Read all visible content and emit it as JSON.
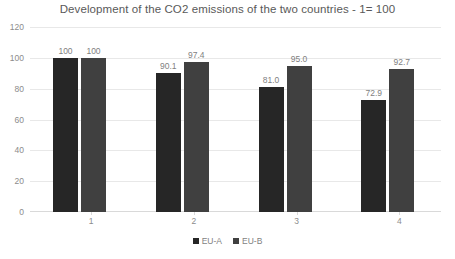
{
  "chart_data": {
    "type": "bar",
    "title": "Development of the CO2 emissions of the two countries - 1= 100",
    "xlabel": "",
    "ylabel": "",
    "categories": [
      "1",
      "2",
      "3",
      "4"
    ],
    "series": [
      {
        "name": "EU-A",
        "color": "#262626",
        "values": [
          100,
          90.1,
          81.0,
          72.9
        ],
        "labels": [
          "100",
          "90.1",
          "81.0",
          "72.9"
        ]
      },
      {
        "name": "EU-B",
        "color": "#404040",
        "values": [
          100,
          97.4,
          95.0,
          92.7
        ],
        "labels": [
          "100",
          "97.4",
          "95.0",
          "92.7"
        ]
      }
    ],
    "ylim": [
      0,
      120
    ],
    "yticks": [
      120,
      100,
      80,
      60,
      40,
      20,
      0
    ],
    "ytick_labels": [
      "120",
      "100",
      "80",
      "60",
      "40",
      "20",
      "0"
    ],
    "grid": true,
    "legend_position": "bottom",
    "data_labels": true
  },
  "colors": {
    "background": "#ffffff",
    "gridline": "#e8e8e8",
    "axis": "#d9d9d9",
    "title_text": "#595959",
    "tick_text": "#8c8c8c",
    "label_text": "#7f7f7f",
    "series_a": "#262626",
    "series_b": "#404040"
  }
}
